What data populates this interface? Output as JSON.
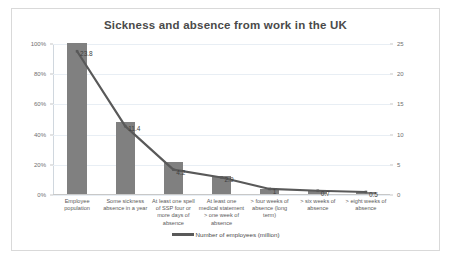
{
  "chart_data": {
    "type": "bar",
    "title": "Sickness and absence from work in the UK",
    "xlabel": "",
    "ylabel": "",
    "categories": [
      "Employee population",
      "Some sickness absence in a year",
      "At least one spell of SSP four or more days of absence",
      "At least one medical statement > one week of absence",
      "> four weeks of absence (long term)",
      "> six weeks of absence",
      "> eight weeks of absence"
    ],
    "series": [
      {
        "name": "Percentage of employee population",
        "axis": "left",
        "unit": "%",
        "values": [
          100,
          48,
          21,
          12,
          3,
          2,
          1.5
        ]
      },
      {
        "name": "Number of employees (million)",
        "axis": "right",
        "unit": "million",
        "values": [
          23.8,
          11.4,
          4.2,
          2.9,
          1.0,
          0.7,
          0.5
        ],
        "labels": [
          "23.8",
          "11.4",
          "4.2",
          "2.9",
          "1",
          "0.7",
          "0.5"
        ]
      }
    ],
    "left_axis": {
      "ticks": [
        "0%",
        "20%",
        "40%",
        "60%",
        "80%",
        "100%"
      ],
      "values": [
        0,
        20,
        40,
        60,
        80,
        100
      ],
      "ylim": [
        0,
        100
      ]
    },
    "right_axis": {
      "ticks": [
        "0",
        "5",
        "10",
        "15",
        "20",
        "25"
      ],
      "values": [
        0,
        5,
        10,
        15,
        20,
        25
      ],
      "ylim": [
        0,
        25
      ]
    },
    "grid": true,
    "legend": {
      "position": "bottom",
      "entries": [
        "Number of employees (million)"
      ]
    },
    "colors": {
      "bar": "#808080",
      "line": "#595959",
      "grid": "#e8eef4",
      "title_text": "#4a4a4a",
      "axis_text": "#6f6f6f",
      "frame": "#d9d9d9"
    }
  }
}
